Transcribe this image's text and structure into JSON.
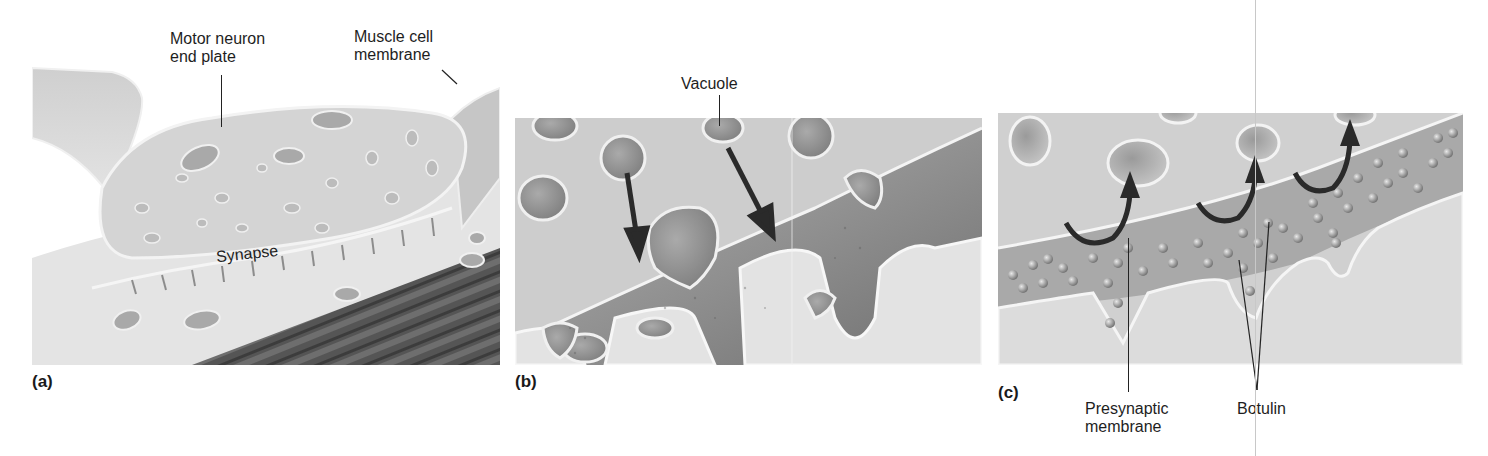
{
  "figure": {
    "panels": [
      {
        "id": "a",
        "label": "(a)",
        "callouts": {
          "motor_neuron": "Motor neuron\nend plate",
          "motor_neuron_line1": "Motor neuron",
          "motor_neuron_line2": "end plate",
          "muscle_line1": "Muscle cell",
          "muscle_line2": "membrane",
          "synapse": "Synapse"
        }
      },
      {
        "id": "b",
        "label": "(b)",
        "callouts": {
          "vacuole": "Vacuole"
        }
      },
      {
        "id": "c",
        "label": "(c)",
        "callouts": {
          "presynaptic_line1": "Presynaptic",
          "presynaptic_line2": "membrane",
          "botulin": "Botulin"
        }
      }
    ],
    "colors": {
      "background": "#ffffff",
      "cell_light": "#d9d9d9",
      "cell_mid": "#bdbdbd",
      "cleft_dark": "#8a8a8a",
      "muscle_fiber": "#4a4a4a",
      "arrow": "#2a2a2a",
      "membrane_outline": "#f2f2f2"
    }
  }
}
